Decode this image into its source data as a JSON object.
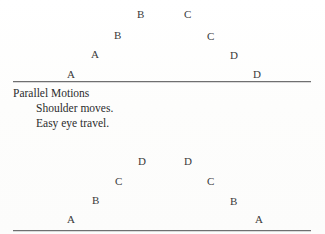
{
  "page": {
    "background_color": "#fefefe",
    "ink_color": "#3a3a3a",
    "rule_color": "#6f6f70"
  },
  "caption": {
    "title": "Parallel Motions",
    "lines": [
      "Shoulder moves.",
      "Easy eye travel."
    ]
  },
  "diagrams": [
    {
      "name": "upper-arc-diagram",
      "baseline_label": "",
      "marks": [
        {
          "label": "A",
          "x": 67,
          "y": 69
        },
        {
          "label": "A",
          "x": 91,
          "y": 49
        },
        {
          "label": "B",
          "x": 114,
          "y": 30
        },
        {
          "label": "B",
          "x": 137,
          "y": 9
        },
        {
          "label": "C",
          "x": 184,
          "y": 9
        },
        {
          "label": "C",
          "x": 207,
          "y": 31
        },
        {
          "label": "D",
          "x": 230,
          "y": 50
        },
        {
          "label": "D",
          "x": 253,
          "y": 69
        }
      ]
    },
    {
      "name": "lower-arc-diagram",
      "baseline_label": "",
      "marks": [
        {
          "label": "A",
          "x": 67,
          "y": 64
        },
        {
          "label": "B",
          "x": 92,
          "y": 45
        },
        {
          "label": "C",
          "x": 115,
          "y": 26
        },
        {
          "label": "D",
          "x": 138,
          "y": 6
        },
        {
          "label": "D",
          "x": 184,
          "y": 6
        },
        {
          "label": "C",
          "x": 207,
          "y": 26
        },
        {
          "label": "B",
          "x": 230,
          "y": 46
        },
        {
          "label": "A",
          "x": 255,
          "y": 64
        }
      ]
    }
  ]
}
